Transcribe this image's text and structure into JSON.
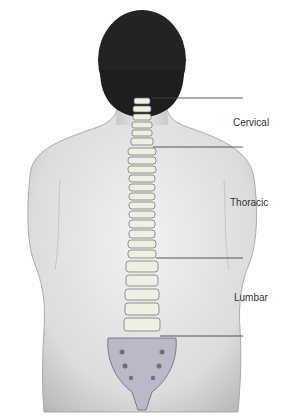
{
  "figure": {
    "regions": [
      {
        "name": "Cervical",
        "label_y": 127
      },
      {
        "name": "Thoracic",
        "label_y": 207
      },
      {
        "name": "Lumbar",
        "label_y": 302
      }
    ],
    "leader_lines_y": [
      98,
      147,
      258,
      336
    ],
    "colors": {
      "skin": "#d9d9d9",
      "skin_shadow": "#a8a8a8",
      "hair": "#1e1e1e",
      "bone": "#efefe4",
      "bone_outline": "#6a6a6a",
      "sacrum": "#b9b9c8",
      "line": "#444444",
      "text": "#333333"
    }
  }
}
